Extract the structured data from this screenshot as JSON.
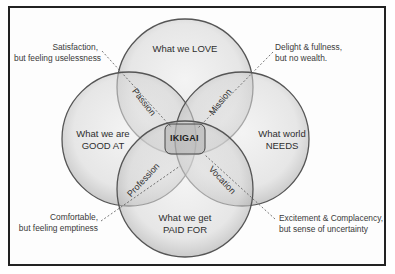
{
  "diagram": {
    "center_label": "IKIGAI",
    "circles": [
      {
        "id": "love",
        "line1": "What we LOVE",
        "line2": ""
      },
      {
        "id": "good",
        "line1": "What we are",
        "line2": "GOOD AT"
      },
      {
        "id": "needs",
        "line1": "What world",
        "line2": "NEEDS"
      },
      {
        "id": "paid",
        "line1": "What we get",
        "line2": "PAID FOR"
      }
    ],
    "intersections": [
      {
        "id": "passion",
        "label": "Passion"
      },
      {
        "id": "mission",
        "label": "Mission"
      },
      {
        "id": "profession",
        "label": "Profession"
      },
      {
        "id": "vocation",
        "label": "Vocation"
      }
    ],
    "annotations": [
      {
        "id": "passion-note",
        "line1": "Satisfaction,",
        "line2": "but feeling uselessness"
      },
      {
        "id": "mission-note",
        "line1": "Delight & fullness,",
        "line2": "but no wealth."
      },
      {
        "id": "profession-note",
        "line1": "Comfortable,",
        "line2": "but feeling emptiness"
      },
      {
        "id": "vocation-note",
        "line1": "Excitement & Complacency,",
        "line2": "but sense of uncertainty"
      }
    ],
    "colors": {
      "circle_fill": "#d9d9d9",
      "circle_stroke": "#555555",
      "frame": "#222222",
      "text": "#2e2e2e"
    }
  }
}
